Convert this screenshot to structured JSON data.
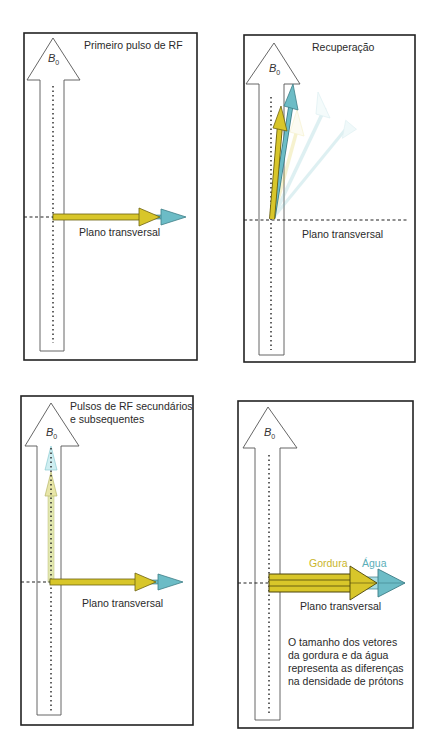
{
  "panels": [
    {
      "id": "primeiro-pulso",
      "title": "Primeiro pulso de RF",
      "field_label": "B",
      "field_subscript": "0",
      "plane_label": "Plano transversal"
    },
    {
      "id": "recuperacao",
      "title": "Recuperação",
      "field_label": "B",
      "field_subscript": "0",
      "plane_label": "Plano transversal"
    },
    {
      "id": "pulsos-secundarios",
      "title_line1": "Pulsos de RF secundários",
      "title_line2": "e subsequentes",
      "field_label": "B",
      "field_subscript": "0",
      "plane_label": "Plano transversal"
    },
    {
      "id": "densidade-protons",
      "field_label": "B",
      "field_subscript": "0",
      "plane_label": "Plano transversal",
      "legend": {
        "fat": "Gordura",
        "water": "Água"
      },
      "note_lines": [
        "O tamanho dos vetores",
        "da gordura e da água",
        "representa as diferenças",
        "na densidade de prótons"
      ]
    }
  ],
  "colors": {
    "fat": "#d8c62a",
    "fat_dark": "#8a7d10",
    "water": "#6cbcc6",
    "water_dark": "#3d7d86",
    "frame": "#222222",
    "b0_outline": "#555555"
  }
}
